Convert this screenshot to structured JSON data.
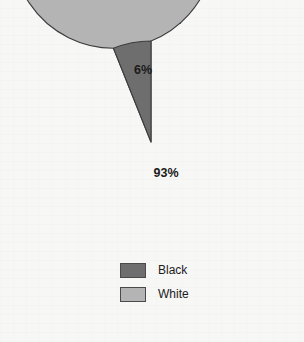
{
  "chart_data": {
    "type": "pie",
    "title": "1865–1877",
    "categories": [
      "Black",
      "White"
    ],
    "values": [
      6,
      93
    ],
    "value_labels": [
      "6%",
      "93%"
    ],
    "units": "percent",
    "colors": [
      "#6e6e6e",
      "#b4b4b4"
    ],
    "start_angle_deg": 0,
    "direction": "counterclockwise",
    "legend_position": "bottom",
    "grid": false,
    "xlabel": "",
    "ylabel": "",
    "slices": [
      {
        "label": "Black",
        "value": 6,
        "value_label": "6%",
        "color": "#6e6e6e"
      },
      {
        "label": "White",
        "value": 93,
        "value_label": "93%",
        "color": "#b4b4b4"
      }
    ]
  },
  "figure": {
    "background_color": "#f7f7f5",
    "outline_color": "#3d3d3d"
  },
  "legend": {
    "items": [
      {
        "label": "Black",
        "color": "#6e6e6e"
      },
      {
        "label": "White",
        "color": "#b4b4b4"
      }
    ]
  }
}
